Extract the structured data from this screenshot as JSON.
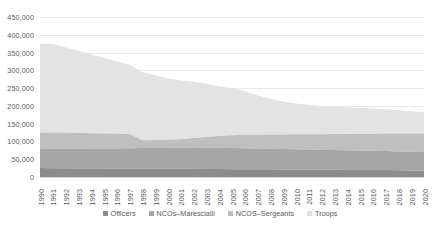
{
  "chart_data": {
    "type": "area",
    "stacked": true,
    "title": "",
    "subtitle": "",
    "xlabel": "",
    "ylabel": "",
    "grid": true,
    "legend_position": "bottom",
    "ylim": [
      0,
      450000
    ],
    "y_ticks": [
      0,
      50000,
      100000,
      150000,
      200000,
      250000,
      300000,
      350000,
      400000,
      450000
    ],
    "y_tick_labels": [
      "0",
      "50,000",
      "100,000",
      "150,000",
      "200,000",
      "250,000",
      "300,000",
      "350,000",
      "400,000",
      "450,000"
    ],
    "categories": [
      "1990",
      "1991",
      "1992",
      "1993",
      "1994",
      "1995",
      "1996",
      "1997",
      "1998",
      "1999",
      "2000",
      "2001",
      "2002",
      "2003",
      "2004",
      "2005",
      "2006",
      "2007",
      "2008",
      "2009",
      "2010",
      "2011",
      "2012",
      "2013",
      "2014",
      "2015",
      "2016",
      "2017",
      "2018",
      "2019",
      "2020"
    ],
    "series": [
      {
        "name": "Officers",
        "color": "#8c8c8c",
        "values": [
          25000,
          24500,
          24500,
          24000,
          24000,
          24000,
          23500,
          23500,
          23500,
          23000,
          23000,
          23000,
          23000,
          22500,
          22500,
          22000,
          22000,
          21500,
          21500,
          21000,
          21000,
          21000,
          20500,
          20500,
          20000,
          20000,
          19500,
          19500,
          19000,
          18500,
          18000
        ]
      },
      {
        "name": "NCOs–Marescialli",
        "color": "#a6a6a6",
        "values": [
          55000,
          55000,
          55000,
          55500,
          56000,
          56500,
          57000,
          57500,
          58000,
          58500,
          59000,
          59500,
          60000,
          60000,
          60000,
          59500,
          59000,
          58500,
          58000,
          57500,
          57000,
          56500,
          56000,
          55500,
          55000,
          54500,
          54000,
          53500,
          53000,
          52500,
          52000
        ]
      },
      {
        "name": "NCOS–Sergeants",
        "color": "#bfbfbf",
        "values": [
          45000,
          45000,
          45000,
          44000,
          43000,
          42000,
          41000,
          40000,
          22000,
          22500,
          23000,
          24000,
          27000,
          30000,
          33000,
          36000,
          38000,
          39000,
          40000,
          41000,
          42000,
          43000,
          44000,
          45000,
          46000,
          47000,
          48000,
          49000,
          50000,
          51000,
          52000
        ]
      },
      {
        "name": "Troops",
        "color": "#e3e3e3",
        "values": [
          250000,
          250000,
          240000,
          231500,
          222000,
          212500,
          203000,
          195000,
          191500,
          182000,
          172000,
          165000,
          158000,
          149500,
          140000,
          132500,
          122000,
          111000,
          100500,
          93000,
          87000,
          82000,
          79500,
          77000,
          75000,
          73000,
          71000,
          68500,
          66000,
          63000,
          60000
        ]
      }
    ],
    "legend": [
      {
        "label": "Officers",
        "color": "#8c8c8c"
      },
      {
        "label": "NCOs–Marescialli",
        "color": "#a6a6a6"
      },
      {
        "label": "NCOS–Sergeants",
        "color": "#bfbfbf"
      },
      {
        "label": "Troops",
        "color": "#e3e3e3"
      }
    ],
    "colors": {
      "gridline": "#e8e8e8",
      "axis_text": "#595959",
      "background": "#ffffff"
    }
  }
}
